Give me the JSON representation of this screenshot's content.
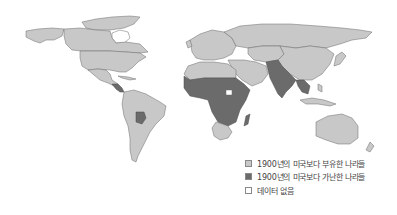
{
  "map": {
    "title": "",
    "projection": "world",
    "categories": [
      {
        "key": "richer",
        "label": "1900년의 미국보다 부유한 나라들",
        "color": "#c8c8c8"
      },
      {
        "key": "poorer",
        "label": "1900년의 미국보다 가난한 나라들",
        "color": "#6b6b6b"
      },
      {
        "key": "no_data",
        "label": "데이터 없음",
        "color": "#ffffff"
      }
    ],
    "regions": {
      "north_america": "richer",
      "greenland": "no_data",
      "central_america_south": "poorer",
      "south_america": "richer",
      "bolivia": "poorer",
      "europe": "richer",
      "russia": "richer",
      "north_africa": "richer",
      "sub_saharan_africa": "poorer",
      "southern_africa": "richer",
      "madagascar": "poorer",
      "middle_east": "richer",
      "south_asia": "poorer",
      "southeast_asia_mainland": "poorer",
      "china": "richer",
      "australia": "richer"
    }
  },
  "legend": {
    "items": [
      {
        "label": "1900년의 미국보다 부유한 나라들",
        "color": "#c8c8c8"
      },
      {
        "label": "1900년의 미국보다 가난한 나라들",
        "color": "#6b6b6b"
      },
      {
        "label": "데이터 없음",
        "color": "#ffffff"
      }
    ]
  }
}
